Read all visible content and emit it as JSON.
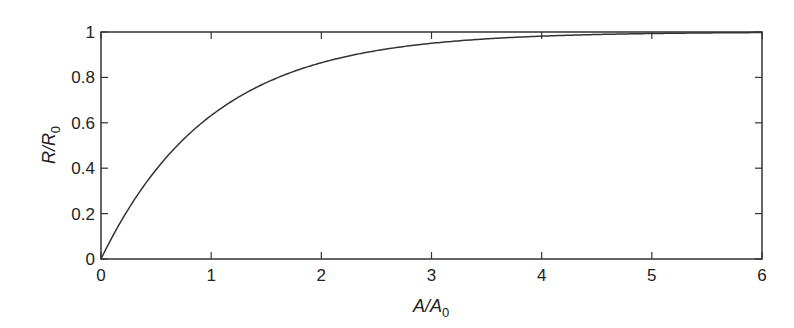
{
  "chart_data": {
    "type": "line",
    "title": "",
    "xlabel": "A/A0",
    "xlabel_main": "A/A",
    "xlabel_sub": "0",
    "ylabel": "R/R0",
    "ylabel_main": "R/R",
    "ylabel_sub": "0",
    "xlim": [
      0,
      6
    ],
    "ylim": [
      0,
      1
    ],
    "xticks": [
      "0",
      "1",
      "2",
      "3",
      "4",
      "5",
      "6"
    ],
    "yticks": [
      "0",
      "0.2",
      "0.4",
      "0.6",
      "0.8",
      "1"
    ],
    "grid": false,
    "legend": null,
    "series": [
      {
        "name": "R/R0 = 1 - exp(-A/A0)",
        "color": "#333333",
        "x": [
          0,
          0.25,
          0.5,
          0.75,
          1,
          1.25,
          1.5,
          1.75,
          2,
          2.5,
          3,
          3.5,
          4,
          4.5,
          5,
          5.5,
          6
        ],
        "y": [
          0,
          0.221,
          0.393,
          0.528,
          0.632,
          0.713,
          0.777,
          0.826,
          0.865,
          0.918,
          0.95,
          0.97,
          0.982,
          0.989,
          0.993,
          0.996,
          0.998
        ]
      }
    ]
  }
}
